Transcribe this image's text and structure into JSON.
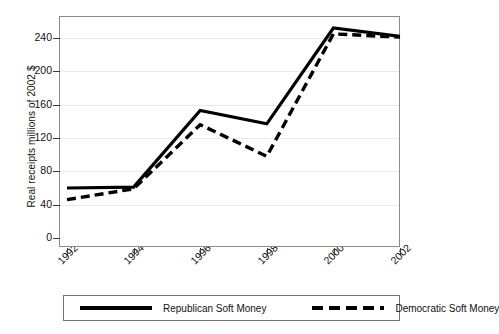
{
  "chart_data": {
    "type": "line",
    "title": "",
    "xlabel": "",
    "ylabel": "Real receipts millions of 2002 $",
    "categories": [
      "1992",
      "1994",
      "1996",
      "1998",
      "2000",
      "2002"
    ],
    "x": [
      1992,
      1994,
      1996,
      1998,
      2000,
      2002
    ],
    "xlim": [
      1992,
      2002
    ],
    "ylim": [
      0,
      260
    ],
    "yticks": [
      0,
      40,
      80,
      120,
      160,
      200,
      240
    ],
    "ytick_labels": [
      "0",
      "40",
      "80",
      "120",
      "160",
      "200",
      "240"
    ],
    "xtick_labels": [
      "1992",
      "1994",
      "1996",
      "1998",
      "2000",
      "2002"
    ],
    "grid": "horizontal",
    "legend_position": "below-plot",
    "series": [
      {
        "name": "Republican Soft Money",
        "style": "solid",
        "color": "#000000",
        "values": [
          60,
          61,
          153,
          137,
          252,
          242
        ]
      },
      {
        "name": "Democratic Soft Money",
        "style": "dashed",
        "color": "#000000",
        "values": [
          46,
          59,
          136,
          98,
          245,
          241
        ]
      }
    ]
  },
  "axis": {
    "y_title": "Real receipts millions of 2002 $",
    "y_ticks": [
      "240",
      "200",
      "160",
      "120",
      "80",
      "40",
      "0"
    ],
    "x_ticks": [
      "1992",
      "1994",
      "1996",
      "1998",
      "2000",
      "2002"
    ]
  },
  "legend": {
    "republican_label": "Republican Soft Money",
    "democratic_label": "Democratic Soft Money"
  }
}
